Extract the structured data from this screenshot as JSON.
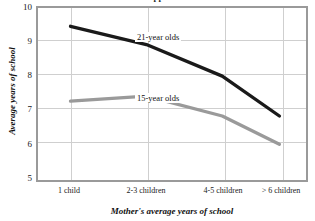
{
  "chart_data": {
    "type": "line",
    "title": "",
    "xlabel": "Mother's average years of school",
    "ylabel": "Average years of school",
    "categories": [
      "1 child",
      "2-3 children",
      "4-5  children",
      "> 6  children"
    ],
    "ylim": [
      5,
      10
    ],
    "yticks": [
      "5",
      "6",
      "7",
      "8",
      "9",
      "10"
    ],
    "grid": "both",
    "legend_position": "inline-annotations",
    "series": [
      {
        "name": "21-year olds",
        "color": "#1a1a1a",
        "values": [
          9.45,
          8.9,
          7.95,
          6.75
        ]
      },
      {
        "name": "15-year olds",
        "color": "#9a9a9a",
        "values": [
          7.2,
          7.35,
          6.75,
          5.9
        ]
      }
    ],
    "annotations": [
      {
        "text": "21-year olds",
        "series": "21-year olds"
      },
      {
        "text": "15-year olds",
        "series": "15-year olds"
      }
    ]
  },
  "colors": {
    "series_21": "#1a1a1a",
    "series_15": "#9a9a9a",
    "frame": "#9a9a9a",
    "gridline": "#cfcfcf",
    "text": "#111111",
    "background": "#ffffff"
  },
  "title_partial": "Cropped chart title"
}
